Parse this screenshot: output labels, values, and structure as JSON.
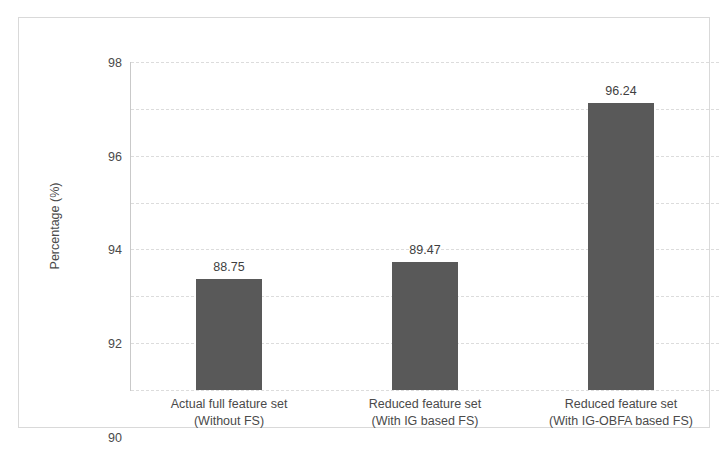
{
  "chart_data": {
    "type": "bar",
    "title": "",
    "xlabel": "",
    "ylabel": "Percentage (%)",
    "ylim": [
      84,
      98
    ],
    "ytick_step": 2,
    "yticks": [
      84,
      86,
      88,
      90,
      92,
      94,
      96,
      98
    ],
    "grid": true,
    "legend": "none",
    "bar_color": "#595959",
    "categories": [
      "Actual full feature set (Without FS)",
      "Reduced feature set (With IG based FS)",
      "Reduced feature set (With IG-OBFA based FS)"
    ],
    "category_lines": [
      {
        "line1": "Actual full feature set",
        "line2": "(Without FS)"
      },
      {
        "line1": "Reduced feature set",
        "line2": "(With IG based FS)"
      },
      {
        "line1": "Reduced feature set",
        "line2": "(With IG-OBFA based FS)"
      }
    ],
    "values": [
      88.75,
      89.47,
      96.24
    ],
    "value_labels": [
      "88.75",
      "89.47",
      "96.24"
    ]
  }
}
